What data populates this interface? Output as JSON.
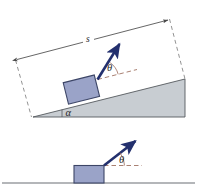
{
  "figure": {
    "background_color": "#ffffff",
    "panels": [
      {
        "id": "top-panel",
        "name": "inclined-plane-panel",
        "description": "Block resting on an inclined plane of angle alpha, pulled by a force arrow at angle theta above the incline surface, with a dimension line of length s along the incline",
        "labels": {
          "displacement": "s",
          "force_angle": "θ",
          "incline_angle": "α"
        }
      },
      {
        "id": "bottom-panel",
        "name": "horizontal-ground-panel",
        "description": "Block resting on horizontal ground pulled by a force arrow at angle theta above the horizontal",
        "labels": {
          "force_angle": "θ"
        }
      }
    ]
  },
  "colors": {
    "block_fill": "#9aa3c8",
    "block_stroke": "#3c4566",
    "incline_fill": "#c8cdd2",
    "incline_stroke": "#55595e",
    "arrow": "#23306e",
    "dimension_line": "#4a4a4a",
    "dashed_reference": "#9a6a5a",
    "ground_line": "#6b6f74",
    "label_text": "#2b2b2b"
  },
  "geometry": {
    "incline_angle_deg": 13,
    "force_angle_above_surface_deg": 40,
    "dimension_label_position": "above-midline"
  }
}
